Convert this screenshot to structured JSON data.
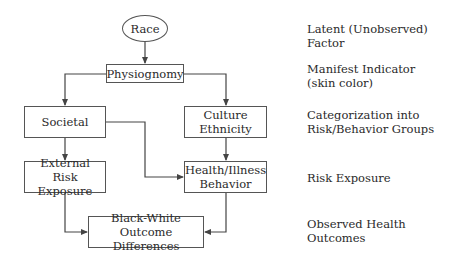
{
  "nodes": {
    "race": {
      "text": "Race"
    },
    "physiognomy": {
      "text": "Physiognomy"
    },
    "societal": {
      "text": "Societal"
    },
    "culture": {
      "line1": "Culture",
      "line2": "Ethnicity"
    },
    "external": {
      "line1": "External",
      "line2": "Risk Exposure"
    },
    "health": {
      "line1": "Health/Illness",
      "line2": "Behavior"
    },
    "outcome": {
      "line1": "Black-White",
      "line2": "Outcome Differences"
    }
  },
  "levels": [
    {
      "line1": "Latent (Unobserved) Factor",
      "line2": ""
    },
    {
      "line1": "Manifest Indicator",
      "line2": "(skin color)"
    },
    {
      "line1": "Categorization into",
      "line2": "Risk/Behavior Groups"
    },
    {
      "line1": "Risk Exposure",
      "line2": ""
    },
    {
      "line1": "Observed Health",
      "line2": "Outcomes"
    }
  ],
  "edges": [
    {
      "from": "race",
      "to": "physiognomy"
    },
    {
      "from": "physiognomy",
      "to": "societal"
    },
    {
      "from": "physiognomy",
      "to": "culture"
    },
    {
      "from": "societal",
      "to": "external"
    },
    {
      "from": "societal",
      "to": "health"
    },
    {
      "from": "culture",
      "to": "health"
    },
    {
      "from": "external",
      "to": "outcome"
    },
    {
      "from": "health",
      "to": "outcome"
    }
  ],
  "colors": {
    "line": "#444444",
    "text": "#2a2a2a",
    "background": "#ffffff"
  }
}
